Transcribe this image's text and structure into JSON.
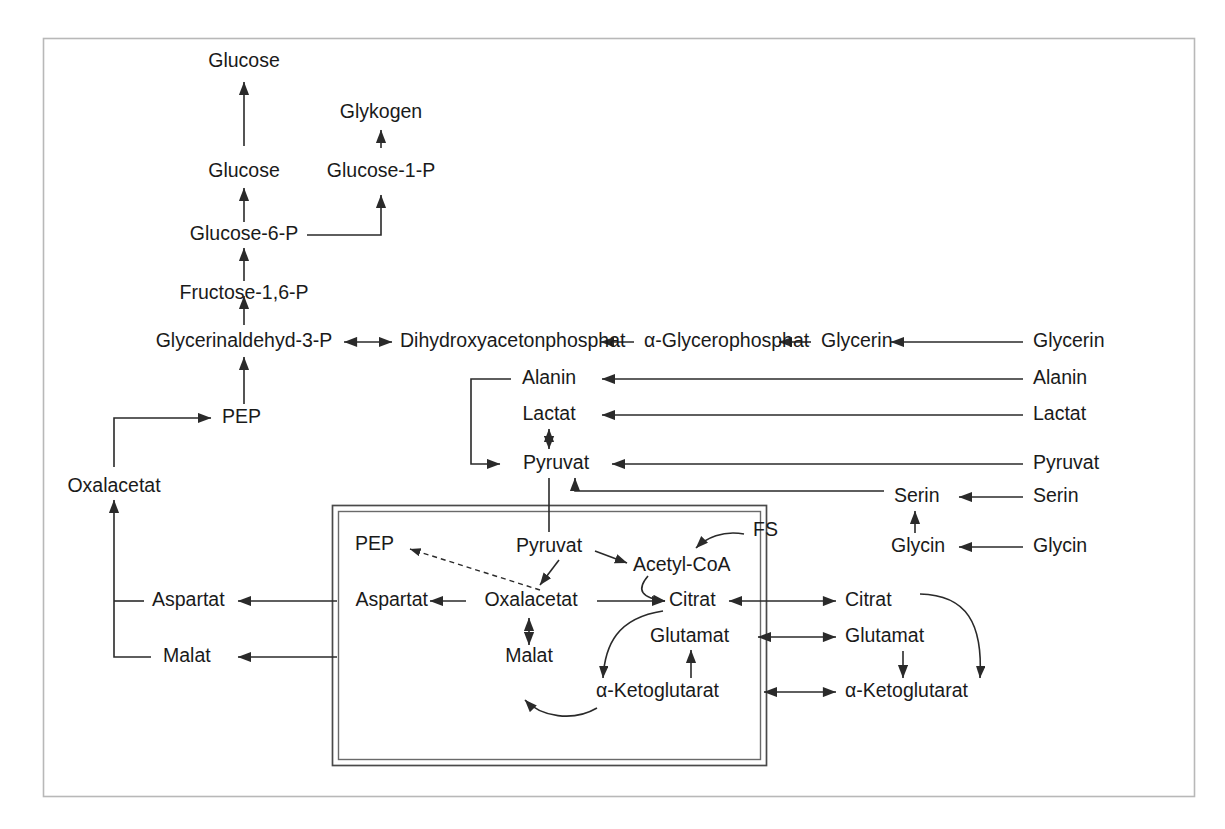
{
  "diagram": {
    "language": "de",
    "frame": {
      "color": "#b8b8b8"
    },
    "membrane": {
      "label": "mitochondrial-membrane",
      "color": "#4a4a4a"
    },
    "nodes": {
      "glucose_out": "Glucose",
      "glykogen": "Glykogen",
      "glucose_cell": "Glucose",
      "glucose1p": "Glucose-1-P",
      "glucose6p": "Glucose-6-P",
      "fructose16p": "Fructose-1,6-P",
      "glycerinaldehyd3p": "Glycerinaldehyd-3-P",
      "dhap": "Dihydroxyacetonphosphat",
      "alpha_glycerophosphat": "α-Glycerophosphat",
      "glycerin_cyt": "Glycerin",
      "glycerin_ext": "Glycerin",
      "pep_cyt": "PEP",
      "alanin_cyt": "Alanin",
      "alanin_ext": "Alanin",
      "lactat_cyt": "Lactat",
      "lactat_ext": "Lactat",
      "pyruvat_cyt": "Pyruvat",
      "pyruvat_ext": "Pyruvat",
      "serin_cyt": "Serin",
      "serin_ext": "Serin",
      "glycin_cyt": "Glycin",
      "glycin_ext": "Glycin",
      "oxalacetat_cyt": "Oxalacetat",
      "aspartat_cyt": "Aspartat",
      "malat_cyt": "Malat",
      "pep_mito": "PEP",
      "pyruvat_mito": "Pyruvat",
      "acetyl_coa": "Acetyl-CoA",
      "fs": "FS",
      "oxalacetat_mito": "Oxalacetat",
      "aspartat_mito": "Aspartat",
      "malat_mito": "Malat",
      "citrat_mito": "Citrat",
      "citrat_cyt": "Citrat",
      "glutamat_mito": "Glutamat",
      "glutamat_cyt": "Glutamat",
      "ketoglutarat_mito": "α-Ketoglutarat",
      "ketoglutarat_cyt": "α-Ketoglutarat"
    }
  }
}
